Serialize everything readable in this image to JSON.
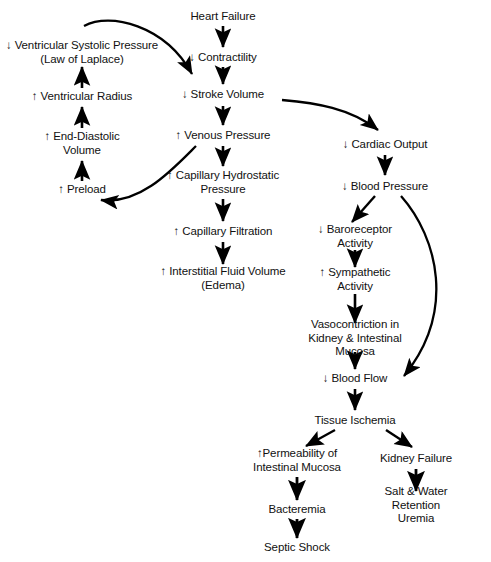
{
  "diagram": {
    "canvas": {
      "width": 491,
      "height": 562,
      "background": "#ffffff"
    },
    "stroke_color": "#000000",
    "text_color": "#111111",
    "nodes": [
      {
        "id": "heart-failure",
        "label": "Heart Failure",
        "x": 223,
        "y": 17
      },
      {
        "id": "contractility",
        "label": "↓ Contractility",
        "x": 223,
        "y": 58
      },
      {
        "id": "ventricular-systolic-pressure",
        "label": "↓ Ventricular Systolic Pressure\n(Law of Laplace)",
        "x": 82,
        "y": 52
      },
      {
        "id": "ventricular-radius",
        "label": "↑ Ventricular Radius",
        "x": 82,
        "y": 97
      },
      {
        "id": "end-diastolic-volume",
        "label": "↑ End-Diastolic\nVolume",
        "x": 82,
        "y": 143
      },
      {
        "id": "preload",
        "label": "↑ Preload",
        "x": 82,
        "y": 190
      },
      {
        "id": "stroke-volume",
        "label": "↓ Stroke Volume",
        "x": 223,
        "y": 95
      },
      {
        "id": "venous-pressure",
        "label": "↑ Venous Pressure",
        "x": 223,
        "y": 136
      },
      {
        "id": "capillary-hydrostatic-pressure",
        "label": "↑ Capillary Hydrostatic\nPressure",
        "x": 223,
        "y": 182
      },
      {
        "id": "capillary-filtration",
        "label": "↑ Capillary Filtration",
        "x": 223,
        "y": 232
      },
      {
        "id": "interstitial-fluid-volume",
        "label": "↑ Interstitial Fluid Volume\n(Edema)",
        "x": 223,
        "y": 278
      },
      {
        "id": "cardiac-output",
        "label": "↓ Cardiac Output",
        "x": 385,
        "y": 145
      },
      {
        "id": "blood-pressure",
        "label": "↓ Blood Pressure",
        "x": 385,
        "y": 187
      },
      {
        "id": "baroreceptor-activity",
        "label": "↓ Baroreceptor\nActivity",
        "x": 355,
        "y": 236
      },
      {
        "id": "sympathetic-activity",
        "label": "↑ Sympathetic\nActivity",
        "x": 355,
        "y": 279
      },
      {
        "id": "vasoconstriction",
        "label": "Vasocontriction in\nKidney & Intestinal Mucosa",
        "x": 355,
        "y": 338
      },
      {
        "id": "blood-flow",
        "label": "↓ Blood Flow",
        "x": 355,
        "y": 379
      },
      {
        "id": "tissue-ischemia",
        "label": "Tissue Ischemia",
        "x": 355,
        "y": 421
      },
      {
        "id": "permeability-intestinal-mucosa",
        "label": "↑Permeability of\nIntestinal Mucosa",
        "x": 297,
        "y": 460
      },
      {
        "id": "kidney-failure",
        "label": "Kidney Failure",
        "x": 416,
        "y": 459
      },
      {
        "id": "bacteremia",
        "label": "Bacteremia",
        "x": 297,
        "y": 510
      },
      {
        "id": "septic-shock",
        "label": "Septic Shock",
        "x": 297,
        "y": 548
      },
      {
        "id": "salt-water-retention-uremia",
        "label": "Salt & Water Retention\nUremia",
        "x": 416,
        "y": 505
      }
    ],
    "edges": [
      {
        "id": "heart-failure-to-contractility",
        "from": "heart-failure",
        "to": "contractility",
        "kind": "straight"
      },
      {
        "id": "contractility-to-stroke-volume",
        "from": "contractility",
        "to": "stroke-volume",
        "kind": "straight"
      },
      {
        "id": "systolic-pressure-to-stroke-volume",
        "from": "ventricular-systolic-pressure",
        "to": "stroke-volume",
        "kind": "curved"
      },
      {
        "id": "ventricular-radius-to-systolic-pressure",
        "from": "ventricular-radius",
        "to": "ventricular-systolic-pressure",
        "kind": "straight"
      },
      {
        "id": "end-diastolic-to-ventricular-radius",
        "from": "end-diastolic-volume",
        "to": "ventricular-radius",
        "kind": "straight"
      },
      {
        "id": "preload-to-end-diastolic",
        "from": "preload",
        "to": "end-diastolic-volume",
        "kind": "straight"
      },
      {
        "id": "stroke-volume-to-venous-pressure",
        "from": "stroke-volume",
        "to": "venous-pressure",
        "kind": "straight"
      },
      {
        "id": "venous-pressure-to-preload",
        "from": "venous-pressure",
        "to": "preload",
        "kind": "curved"
      },
      {
        "id": "venous-pressure-to-capillary-hydrostatic",
        "from": "venous-pressure",
        "to": "capillary-hydrostatic-pressure",
        "kind": "straight"
      },
      {
        "id": "capillary-hydrostatic-to-filtration",
        "from": "capillary-hydrostatic-pressure",
        "to": "capillary-filtration",
        "kind": "straight"
      },
      {
        "id": "filtration-to-interstitial-fluid",
        "from": "capillary-filtration",
        "to": "interstitial-fluid-volume",
        "kind": "straight"
      },
      {
        "id": "stroke-volume-to-cardiac-output",
        "from": "stroke-volume",
        "to": "cardiac-output",
        "kind": "curved"
      },
      {
        "id": "cardiac-output-to-blood-pressure",
        "from": "cardiac-output",
        "to": "blood-pressure",
        "kind": "straight"
      },
      {
        "id": "blood-pressure-to-baroreceptor",
        "from": "blood-pressure",
        "to": "baroreceptor-activity",
        "kind": "diagonal"
      },
      {
        "id": "blood-pressure-to-blood-flow",
        "from": "blood-pressure",
        "to": "blood-flow",
        "kind": "curved"
      },
      {
        "id": "baroreceptor-to-sympathetic",
        "from": "baroreceptor-activity",
        "to": "sympathetic-activity",
        "kind": "straight"
      },
      {
        "id": "sympathetic-to-vasoconstriction",
        "from": "sympathetic-activity",
        "to": "vasoconstriction",
        "kind": "straight"
      },
      {
        "id": "vasoconstriction-to-blood-flow",
        "from": "vasoconstriction",
        "to": "blood-flow",
        "kind": "straight"
      },
      {
        "id": "blood-flow-to-tissue-ischemia",
        "from": "blood-flow",
        "to": "tissue-ischemia",
        "kind": "straight"
      },
      {
        "id": "tissue-ischemia-to-permeability",
        "from": "tissue-ischemia",
        "to": "permeability-intestinal-mucosa",
        "kind": "diagonal"
      },
      {
        "id": "tissue-ischemia-to-kidney-failure",
        "from": "tissue-ischemia",
        "to": "kidney-failure",
        "kind": "diagonal"
      },
      {
        "id": "permeability-to-bacteremia",
        "from": "permeability-intestinal-mucosa",
        "to": "bacteremia",
        "kind": "straight"
      },
      {
        "id": "bacteremia-to-septic-shock",
        "from": "bacteremia",
        "to": "septic-shock",
        "kind": "straight"
      },
      {
        "id": "kidney-failure-to-salt-water",
        "from": "kidney-failure",
        "to": "salt-water-retention-uremia",
        "kind": "straight"
      }
    ]
  }
}
